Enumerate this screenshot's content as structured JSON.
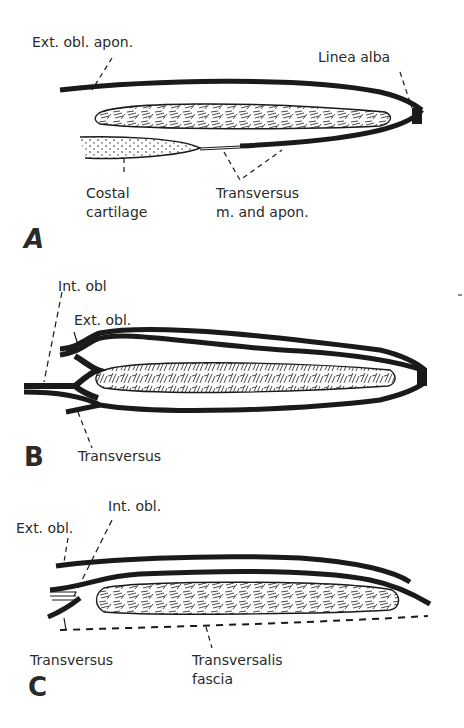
{
  "figure": {
    "panels": [
      {
        "letter": "A",
        "labels": {
          "ext_obl_apon": "Ext. obl. apon.",
          "linea_alba": "Linea alba",
          "costal_line1": "Costal",
          "costal_line2": "cartilage",
          "transversus_line1": "Transversus",
          "transversus_line2": "m. and apon."
        }
      },
      {
        "letter": "B",
        "labels": {
          "int_obl": "Int. obl",
          "ext_obl": "Ext. obl.",
          "transversus": "Transversus"
        }
      },
      {
        "letter": "C",
        "labels": {
          "ext_obl": "Ext. obl.",
          "int_obl": "Int. obl.",
          "transversus": "Transversus",
          "transversalis_line1": "Transversalis",
          "transversalis_line2": "fascia"
        }
      }
    ],
    "colors": {
      "ink": "#1a1a1a",
      "background": "#ffffff"
    }
  }
}
